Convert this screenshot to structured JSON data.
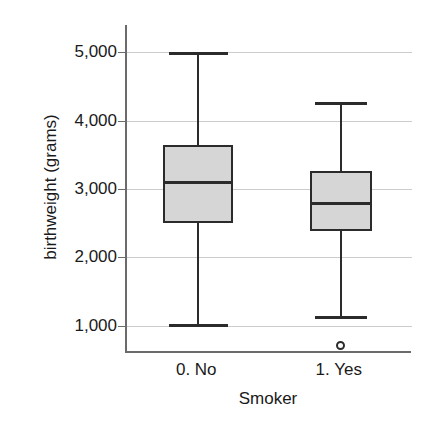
{
  "chart_data": {
    "type": "box",
    "title": "",
    "xlabel": "Smoker",
    "ylabel": "birthweight (grams)",
    "ylim": [
      600,
      5400
    ],
    "yticks": [
      1000,
      2000,
      3000,
      4000,
      5000
    ],
    "ytick_labels": [
      "1,000",
      "2,000",
      "3,000",
      "4,000",
      "5,000"
    ],
    "grid": true,
    "legend": "none",
    "categories": [
      "0. No",
      "1. Yes"
    ],
    "boxes": [
      {
        "category": "0. No",
        "whisker_low": 1020,
        "q1": 2500,
        "median": 3100,
        "q3": 3650,
        "whisker_high": 5000,
        "outliers": []
      },
      {
        "category": "1. Yes",
        "whisker_low": 1140,
        "q1": 2380,
        "median": 2790,
        "q3": 3270,
        "whisker_high": 4280,
        "outliers": [
          715
        ]
      }
    ],
    "colors": {
      "box_fill": "#d6d6d6",
      "box_edge": "#2b2b2b",
      "gridline": "#cccccc",
      "axis": "#6b6b6b",
      "text": "#1a1a1a"
    }
  }
}
